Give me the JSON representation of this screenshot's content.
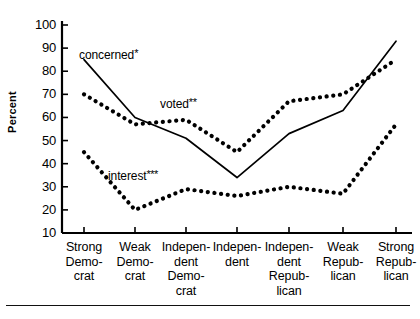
{
  "chart_data": {
    "type": "line",
    "title": "",
    "xlabel": "",
    "ylabel": "Percent",
    "ylim": [
      10,
      100
    ],
    "ytick_step": 10,
    "yticks": [
      100,
      90,
      80,
      70,
      60,
      50,
      40,
      30,
      20,
      10
    ],
    "grid": false,
    "legend_position": "inline-annotations",
    "categories": [
      "Strong Democrat",
      "Weak Democrat",
      "Independent Democrat",
      "Independent",
      "Independent Republican",
      "Weak Republican",
      "Strong Republican"
    ],
    "category_lines": [
      [
        "Strong",
        "Demo-",
        "crat"
      ],
      [
        "Weak",
        "Demo-",
        "crat"
      ],
      [
        "Indepen-",
        "dent",
        "Demo-",
        "crat"
      ],
      [
        "Indepen-",
        "dent"
      ],
      [
        "Indepen-",
        "dent",
        "Repub-",
        "lican"
      ],
      [
        "Weak",
        "Repub-",
        "lican"
      ],
      [
        "Strong",
        "Repub-",
        "lican"
      ]
    ],
    "series": [
      {
        "name": "concerned",
        "label": "concerned",
        "asterisks": "*",
        "style": "solid",
        "color": "#000000",
        "values": [
          85,
          60,
          51,
          34,
          53,
          63,
          93
        ]
      },
      {
        "name": "voted",
        "label": "voted",
        "asterisks": "**",
        "style": "dotted",
        "color": "#000000",
        "values": [
          70,
          57,
          59,
          45,
          67,
          70,
          85
        ]
      },
      {
        "name": "interest",
        "label": "interest",
        "asterisks": "***",
        "style": "dotted",
        "color": "#000000",
        "values": [
          45,
          20,
          29,
          26,
          30,
          27,
          57
        ]
      }
    ]
  }
}
